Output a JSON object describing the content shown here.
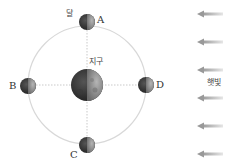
{
  "diagram": {
    "title": "",
    "labels": {
      "moon": "달",
      "earth": "지구",
      "sunlight": "햇빛",
      "position_a": "A",
      "position_b": "B",
      "position_c": "C",
      "position_d": "D"
    },
    "earth": {
      "cx": 87,
      "cy": 85,
      "r": 16
    },
    "orbit": {
      "cx": 87,
      "cy": 85,
      "r": 59,
      "color": "#d8d8d8"
    },
    "moons": [
      {
        "id": "A",
        "cx": 87,
        "cy": 22,
        "r": 8
      },
      {
        "id": "B",
        "cx": 28,
        "cy": 86,
        "r": 8
      },
      {
        "id": "C",
        "cx": 87,
        "cy": 145,
        "r": 8
      },
      {
        "id": "D",
        "cx": 146,
        "cy": 85,
        "r": 8
      }
    ],
    "sunlight_arrows": {
      "direction": "left",
      "count": 6,
      "y_positions": [
        14,
        42,
        70,
        98,
        126,
        154
      ],
      "x_start": 223,
      "x_end": 198,
      "color": "#9a9a9a"
    },
    "colors": {
      "dark_side": "#2b2b2b",
      "lit_side": "#8a8a8a",
      "guide_line": "#bbbbbb"
    }
  }
}
